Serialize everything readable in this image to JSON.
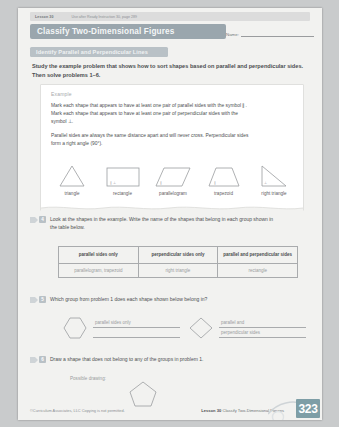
{
  "header": {
    "lesson_tag": "Lesson 30",
    "lesson_note": "Use after Ready Instruction 30, page 289",
    "title": "Classify Two-Dimensional Figures",
    "name_label": "Name:"
  },
  "section_band": {
    "label": "Identify Parallel and Perpendicular Lines"
  },
  "intro": {
    "text": "Study the example problem that shows how to sort shapes based on parallel and perpendicular sides. Then solve problems 1–6."
  },
  "example": {
    "label": "Example",
    "paragraph1": "Mark each shape that appears to have at least one pair of parallel sides with the symbol ∥. Mark each shape that appears to have at least one pair of perpendicular sides with the symbol ⊥.",
    "paragraph2": "Parallel sides are always the same distance apart and will never cross. Perpendicular sides form a right angle (90°).",
    "shapes": [
      {
        "name": "triangle",
        "caption": "triangle",
        "marks": ""
      },
      {
        "name": "rectangle",
        "caption": "rectangle",
        "marks": "∥ ⊥"
      },
      {
        "name": "parallelogram",
        "caption": "parallelogram",
        "marks": "∥"
      },
      {
        "name": "trapezoid",
        "caption": "trapezoid",
        "marks": "∥"
      },
      {
        "name": "right-triangle",
        "caption": "right triangle",
        "marks": "⊥"
      }
    ]
  },
  "problem4": {
    "number": "4",
    "text": "Look at the shapes in the example. Write the name of the shapes that belong in each group shown in the table below.",
    "table": {
      "headers": [
        "parallel sides only",
        "perpendicular sides only",
        "parallel and perpendicular sides"
      ],
      "answers": [
        "parallelogram, trapezoid",
        "right triangle",
        "rectangle"
      ]
    }
  },
  "problem5": {
    "number": "5",
    "text": "Which group from problem 1 does each shape shown below belong in?",
    "items": [
      {
        "shape": "hexagon",
        "answer_line1": "parallel sides only",
        "answer_line2": ""
      },
      {
        "shape": "rhombus",
        "answer_line1": "parallel and",
        "answer_line2": "perpendicular sides"
      }
    ]
  },
  "problem6": {
    "number": "6",
    "text": "Draw a shape that does not belong to any of the groups in problem 1.",
    "possible_label": "Possible drawing:",
    "drawing_shape": "pentagon"
  },
  "footer": {
    "copyright": "©Curriculum Associates, LLC   Copying is not permitted.",
    "lesson_label": "Lesson 30",
    "lesson_title": "Classify Two-Dimensional Figures",
    "page_number": "323"
  },
  "colors": {
    "title_bar": "#9aa6ad",
    "band": "#b9c1c6",
    "page_tab": "#7e9ea6",
    "handwriting": "#9a9da0"
  }
}
